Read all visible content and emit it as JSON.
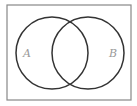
{
  "diagram": {
    "type": "venn",
    "universe": {
      "x": 7,
      "y": 5,
      "width": 124,
      "height": 95
    },
    "sets": [
      {
        "label": "A",
        "cx": 52,
        "cy": 53,
        "r": 36,
        "label_x": 27,
        "label_y": 57
      },
      {
        "label": "B",
        "cx": 88,
        "cy": 53,
        "r": 36,
        "label_x": 113,
        "label_y": 57
      }
    ],
    "stroke_color": "#333333",
    "label_color": "#999999"
  }
}
